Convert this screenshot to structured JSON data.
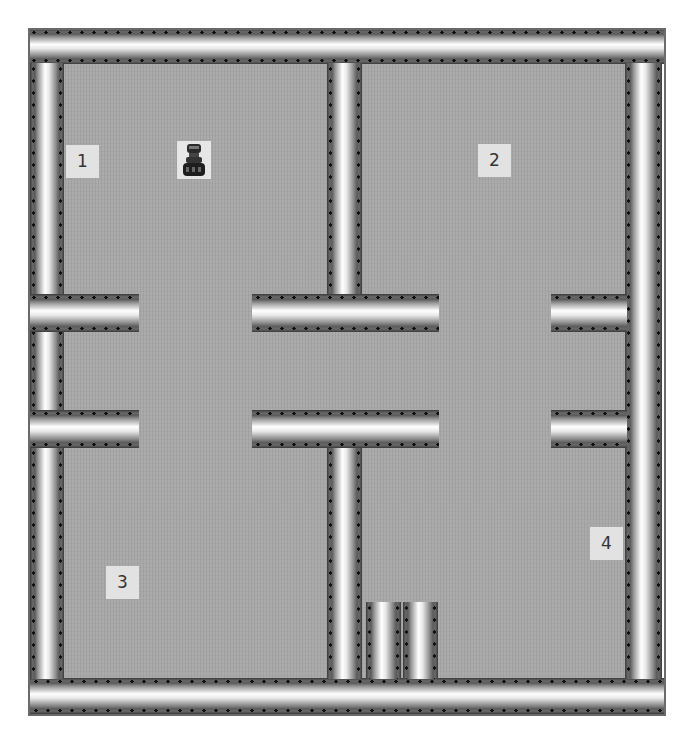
{
  "scene": {
    "type": "top-down grid world / maze with four rooms",
    "colors": {
      "floor": "#a8a8a8",
      "wall_highlight": "#ffffff",
      "wall_shadow": "#3a3a3a",
      "label_bg": "#e2e2e2",
      "label_text": "#333333"
    }
  },
  "rooms": [
    {
      "id": 1,
      "label": "1"
    },
    {
      "id": 2,
      "label": "2"
    },
    {
      "id": 3,
      "label": "3"
    },
    {
      "id": 4,
      "label": "4"
    }
  ],
  "agent": {
    "icon": "robot-icon",
    "room": "1"
  },
  "walls": {
    "outer": [
      "top",
      "bottom",
      "left",
      "right"
    ],
    "inner": [
      "center-vertical-upper",
      "center-vertical-lower",
      "center-horizontal-upper",
      "center-horizontal-lower",
      "left-stub-upper",
      "left-stub-lower",
      "right-stub-upper",
      "right-stub-lower",
      "pillar-1",
      "pillar-2"
    ]
  }
}
